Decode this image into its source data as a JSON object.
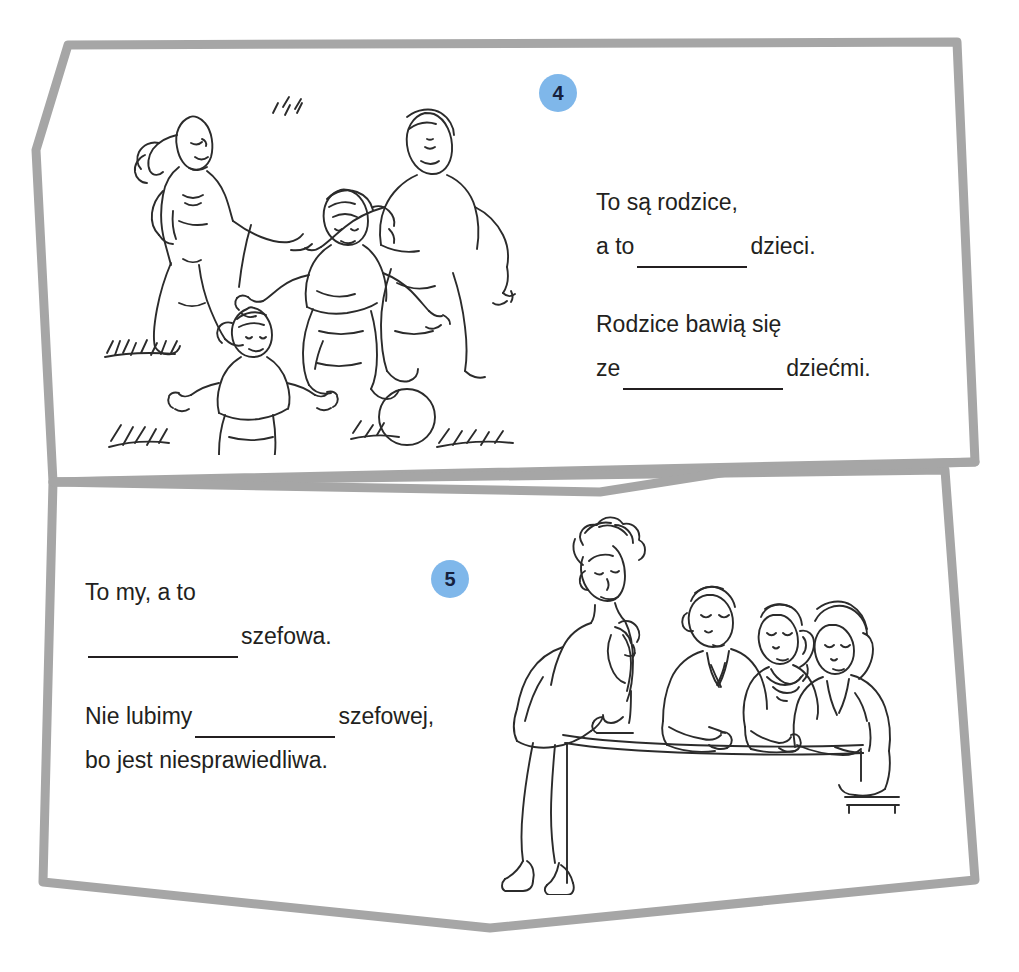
{
  "page": {
    "background_color": "#ffffff",
    "frame_color": "#a6a6a6",
    "text_color": "#231f20",
    "badge_color": "#7FB7EA",
    "badge_text_color": "#16213d"
  },
  "exercises": [
    {
      "number": "4",
      "illustration": "family-playing-ball-illustration",
      "illustration_description": "Mother, father and two children running and playing with a ball on grass",
      "sentences": [
        {
          "lines": [
            {
              "before": "To są rodzice,",
              "blank": false,
              "after": ""
            },
            {
              "before": "a to",
              "blank": true,
              "blank_size": "b-sm",
              "after": "dzieci."
            }
          ]
        },
        {
          "lines": [
            {
              "before": "Rodzice bawią się",
              "blank": false,
              "after": ""
            },
            {
              "before": "ze",
              "blank": true,
              "blank_size": "b-lg",
              "after": "dziećmi."
            }
          ]
        }
      ]
    },
    {
      "number": "5",
      "illustration": "office-boss-and-employees-illustration",
      "illustration_description": "A woman leaning over a desk facing three seated employees in an office",
      "sentences": [
        {
          "lines": [
            {
              "before": "To my, a to",
              "blank": false,
              "after": ""
            },
            {
              "before": "",
              "blank": true,
              "blank_size": "b-md",
              "after": "szefowa."
            }
          ]
        },
        {
          "lines": [
            {
              "before": "Nie lubimy",
              "blank": true,
              "blank_size": "b-md2",
              "after": "szefowej,"
            },
            {
              "before": "bo jest niesprawiedliwa.",
              "blank": false,
              "after": ""
            }
          ]
        }
      ]
    }
  ]
}
